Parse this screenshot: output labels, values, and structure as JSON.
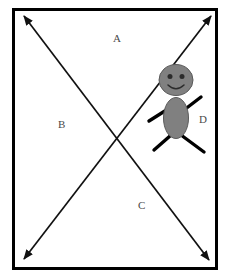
{
  "diagram": {
    "type": "annotated-diagram",
    "canvas": {
      "width": 230,
      "height": 278,
      "background": "#ffffff"
    },
    "frame": {
      "name": "outer-rectangle-border",
      "stroke": "#000000",
      "stroke_width": 3,
      "x": 12,
      "y": 8,
      "width": 206,
      "height": 262
    },
    "regions": [
      {
        "id": "A",
        "label": "A",
        "position": "top",
        "x": 113,
        "y": 33
      },
      {
        "id": "B",
        "label": "B",
        "position": "left",
        "x": 58,
        "y": 119
      },
      {
        "id": "C",
        "label": "C",
        "position": "bottom",
        "x": 138,
        "y": 200
      },
      {
        "id": "D",
        "label": "D",
        "position": "right",
        "x": 199,
        "y": 114
      }
    ],
    "arrows": [
      {
        "name": "diagonal-arrow-top-left-to-lower-right",
        "from": {
          "x": 23,
          "y": 14
        },
        "to": {
          "x": 210,
          "y": 262
        },
        "double_headed": true,
        "stroke": "#111111",
        "stroke_width": 1.6
      },
      {
        "name": "diagonal-arrow-bottom-left-to-top-right",
        "from": {
          "x": 23,
          "y": 260
        },
        "to": {
          "x": 212,
          "y": 14
        },
        "double_headed": true,
        "stroke": "#111111",
        "stroke_width": 1.6
      }
    ],
    "figure": {
      "name": "stick-figure",
      "fill": "#808080",
      "outline": "#4d4d4d",
      "limb_color": "#000000",
      "head": {
        "cx": 176,
        "cy": 80,
        "rx": 17,
        "ry": 15
      },
      "eyes": [
        {
          "cx": 170,
          "cy": 76,
          "r": 2.4
        },
        {
          "cx": 182,
          "cy": 76,
          "r": 2.4
        }
      ],
      "mouth": "smile",
      "torso": {
        "cx": 176,
        "cy": 118,
        "rx": 12,
        "ry": 20
      },
      "left_arm": {
        "x1": 166,
        "y1": 108,
        "x2": 148,
        "y2": 120
      },
      "right_arm": {
        "x1": 186,
        "y1": 108,
        "x2": 201,
        "y2": 97
      },
      "left_leg": {
        "x1": 168,
        "y1": 136,
        "x2": 154,
        "y2": 150
      },
      "right_leg": {
        "x1": 182,
        "y1": 136,
        "x2": 204,
        "y2": 152
      }
    }
  }
}
